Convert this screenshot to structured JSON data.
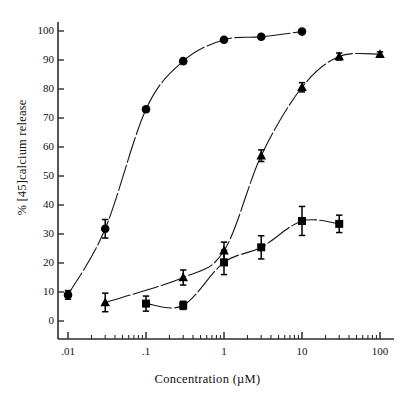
{
  "chart_data": {
    "type": "scatter",
    "title": "",
    "xlabel": "Concentration  (µM)",
    "ylabel": "%  [45]calcium  release",
    "xscale": "log",
    "xlim": [
      0.01,
      100
    ],
    "ylim": [
      0,
      104
    ],
    "grid": false,
    "legend": "none",
    "xtick_labels": [
      ".01",
      ".1",
      "1",
      "10",
      "100"
    ],
    "xtick_values": [
      0.01,
      0.1,
      1,
      10,
      100
    ],
    "ytick_labels": [
      "0",
      "10",
      "20",
      "30",
      "40",
      "50",
      "60",
      "70",
      "80",
      "90",
      "100"
    ],
    "ytick_values": [
      0,
      10,
      20,
      30,
      40,
      50,
      60,
      70,
      80,
      90,
      100
    ],
    "series": [
      {
        "name": "circle-series",
        "marker": "circle",
        "color": "#000000",
        "points": [
          {
            "x": 0.01,
            "y": 9.0,
            "err": 1.5
          },
          {
            "x": 0.03,
            "y": 31.8,
            "err": 3.2
          },
          {
            "x": 0.1,
            "y": 73.0,
            "err": 0.8
          },
          {
            "x": 0.3,
            "y": 89.6,
            "err": 0.8
          },
          {
            "x": 1.0,
            "y": 97.0,
            "err": 0.6
          },
          {
            "x": 3.0,
            "y": 98.0,
            "err": 0.6
          },
          {
            "x": 10.0,
            "y": 99.8,
            "err": 0.6
          }
        ]
      },
      {
        "name": "triangle-series",
        "marker": "triangle",
        "color": "#000000",
        "points": [
          {
            "x": 0.03,
            "y": 6.4,
            "err": 3.2
          },
          {
            "x": 0.3,
            "y": 15.0,
            "err": 2.6
          },
          {
            "x": 1.0,
            "y": 24.2,
            "err": 3.0
          },
          {
            "x": 3.0,
            "y": 57.0,
            "err": 2.0
          },
          {
            "x": 10.0,
            "y": 80.6,
            "err": 1.6
          },
          {
            "x": 30.0,
            "y": 91.2,
            "err": 1.2
          },
          {
            "x": 100.0,
            "y": 92.0,
            "err": 0.8
          }
        ]
      },
      {
        "name": "square-series",
        "marker": "square",
        "color": "#000000",
        "points": [
          {
            "x": 0.1,
            "y": 6.0,
            "err": 2.6
          },
          {
            "x": 0.3,
            "y": 5.4,
            "err": 1.4
          },
          {
            "x": 1.0,
            "y": 20.2,
            "err": 4.2
          },
          {
            "x": 3.0,
            "y": 25.4,
            "err": 4.0
          },
          {
            "x": 10.0,
            "y": 34.5,
            "err": 5.0
          },
          {
            "x": 30.0,
            "y": 33.5,
            "err": 3.0
          }
        ]
      }
    ]
  }
}
